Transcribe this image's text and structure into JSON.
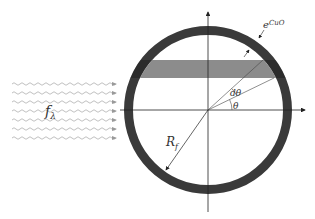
{
  "diagram": {
    "labels": {
      "thickness": "e",
      "thickness_sub": "CuO",
      "flux": "f",
      "flux_sub": "λ",
      "radius": "R",
      "radius_sub": "f",
      "dtheta": "dθ",
      "theta": "θ"
    },
    "colors": {
      "shell": "#3a3a3a",
      "band": "#8c8c8c",
      "axes": "#222222",
      "waves": "#b0b0b0"
    },
    "wave_count": 7
  }
}
